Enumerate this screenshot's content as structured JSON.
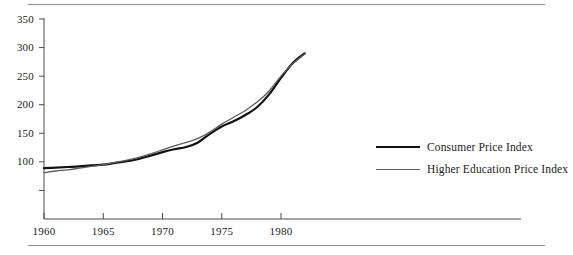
{
  "figure": {
    "background": "#ffffff",
    "rule_color": "#8c8c8c",
    "top_rule": true,
    "bottom_rule": true
  },
  "legend": {
    "position": "right",
    "entries": [
      {
        "label": "Consumer Price Index",
        "color": "#111111",
        "swatch": "line-thick"
      },
      {
        "label": "Higher Education Price Index",
        "color": "#5d5d5d",
        "swatch": "line-thin"
      }
    ]
  },
  "axes": {
    "y_ticks": [
      "350",
      "300",
      "250",
      "200",
      "150",
      "100"
    ],
    "y_unlabeled_ticks": [
      "50"
    ],
    "x_ticks": [
      "1960",
      "1965",
      "1970",
      "1975",
      "1980"
    ]
  },
  "chart_data": {
    "type": "line",
    "title": "",
    "subtitle": "",
    "xlabel": "",
    "ylabel": "",
    "xlim": [
      1960,
      1984
    ],
    "ylim": [
      0,
      350
    ],
    "ytick_values": [
      50,
      100,
      150,
      200,
      250,
      300,
      350
    ],
    "ytick_labels": [
      "",
      "100",
      "150",
      "200",
      "250",
      "300",
      "350"
    ],
    "xtick_values": [
      1960,
      1965,
      1970,
      1975,
      1980
    ],
    "xtick_labels": [
      "1960",
      "1965",
      "1970",
      "1975",
      "1980"
    ],
    "grid": false,
    "legend_position": "right",
    "x": [
      1960,
      1961,
      1962,
      1963,
      1964,
      1965,
      1966,
      1967,
      1968,
      1969,
      1970,
      1971,
      1972,
      1973,
      1974,
      1975,
      1976,
      1977,
      1978,
      1979,
      1980,
      1981,
      1982
    ],
    "series": [
      {
        "name": "Consumer Price Index",
        "color": "#111111",
        "line_width": 2.2,
        "values": [
          89,
          90,
          91,
          92,
          94,
          95,
          98,
          101,
          105,
          111,
          117,
          122,
          126,
          134,
          149,
          162,
          171,
          182,
          196,
          218,
          247,
          273,
          290
        ]
      },
      {
        "name": "Higher Education Price Index",
        "color": "#5d5d5d",
        "line_width": 1.3,
        "values": [
          81,
          84,
          86,
          89,
          92,
          95,
          99,
          103,
          108,
          114,
          121,
          128,
          134,
          141,
          152,
          166,
          178,
          190,
          205,
          224,
          250,
          272,
          289
        ]
      }
    ]
  }
}
